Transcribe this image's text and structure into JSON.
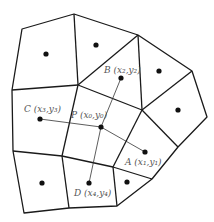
{
  "diagram": {
    "type": "voronoi-tessellation",
    "colors": {
      "edge": "#1a1a1a",
      "site": "#111111",
      "label": "#555555",
      "background": "#ffffff"
    },
    "points": {
      "P": {
        "label": "P (x₀,y₀)",
        "x": 101,
        "y": 127
      },
      "A": {
        "label": "A (x₁,y₁)",
        "x": 145,
        "y": 152
      },
      "B": {
        "label": "B (x₂,y₂)",
        "x": 121,
        "y": 78
      },
      "C": {
        "label": "C (x₃,y₃)",
        "x": 40,
        "y": 119
      },
      "D": {
        "label": "D (x₄,y₄)",
        "x": 89,
        "y": 183
      }
    },
    "connections": [
      {
        "from": "P",
        "to": "A"
      },
      {
        "from": "P",
        "to": "B"
      },
      {
        "from": "P",
        "to": "C"
      },
      {
        "from": "P",
        "to": "D"
      }
    ],
    "other_sites": [
      {
        "x": 46,
        "y": 54
      },
      {
        "x": 96,
        "y": 45
      },
      {
        "x": 159,
        "y": 71
      },
      {
        "x": 178,
        "y": 110
      },
      {
        "x": 42,
        "y": 183
      },
      {
        "x": 127,
        "y": 182
      }
    ]
  }
}
